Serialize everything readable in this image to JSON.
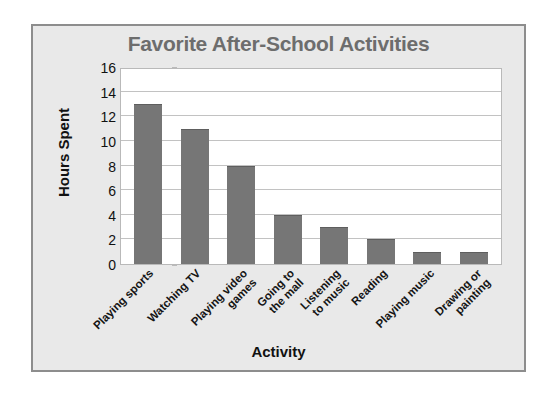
{
  "chart_data": {
    "type": "bar",
    "title": "Favorite After-School Activities",
    "xlabel": "Activity",
    "ylabel": "Hours Spent",
    "categories": [
      "Playing sports",
      "Watching TV",
      "Playing video games",
      "Going to the mall",
      "Listening to music",
      "Reading",
      "Playing music",
      "Drawing or painting"
    ],
    "category_lines": [
      [
        "Playing sports"
      ],
      [
        "Watching TV"
      ],
      [
        "Playing video",
        "games"
      ],
      [
        "Going to",
        "the mall"
      ],
      [
        "Listening",
        "to music"
      ],
      [
        "Reading"
      ],
      [
        "Playing music"
      ],
      [
        "Drawing or",
        "painting"
      ]
    ],
    "values": [
      13,
      11,
      8,
      4,
      3,
      2,
      1,
      1
    ],
    "ylim": [
      0,
      16
    ],
    "yticks": [
      0,
      2,
      4,
      6,
      8,
      10,
      12,
      14,
      16
    ],
    "ytick_labels": [
      "0",
      "2",
      "4",
      "6",
      "8",
      "10",
      "12",
      "14",
      "16"
    ],
    "grid": true,
    "legend": false,
    "colors": {
      "bar": "#767676",
      "title": "#6d6d6d",
      "axis_text": "#111111",
      "gridline": "#c2c2c2",
      "plot_background": "#ffffff",
      "frame_background": "#e9e9e9",
      "frame_border": "#8d8d8d"
    }
  }
}
